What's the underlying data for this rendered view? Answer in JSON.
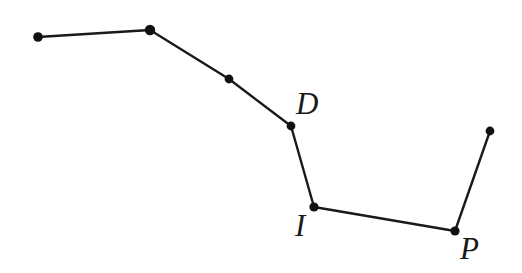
{
  "figure": {
    "background_color": "#ffffff",
    "line_color": "#1a1a1a",
    "node_color": "#111111",
    "label_color": "#1a1a1a",
    "width": 522,
    "height": 273
  },
  "chart_data": {
    "type": "scatter",
    "title": "",
    "xlabel": "",
    "ylabel": "",
    "xlim": [
      0,
      522
    ],
    "ylim": [
      273,
      0
    ],
    "grid": false,
    "legend": null,
    "nodes": [
      {
        "id": "n1",
        "label": "",
        "x": 38,
        "y": 37,
        "radius": 4.8
      },
      {
        "id": "n2",
        "label": "",
        "x": 150,
        "y": 30,
        "radius": 5.2
      },
      {
        "id": "n3",
        "label": "",
        "x": 229,
        "y": 79,
        "radius": 4.4
      },
      {
        "id": "n4",
        "label": "D",
        "x": 291,
        "y": 126,
        "radius": 4.4
      },
      {
        "id": "n5",
        "label": "I",
        "x": 314,
        "y": 207,
        "radius": 4.6
      },
      {
        "id": "n6",
        "label": "P",
        "x": 455,
        "y": 231,
        "radius": 4.6
      },
      {
        "id": "n7",
        "label": "",
        "x": 490,
        "y": 131,
        "radius": 4.4
      }
    ],
    "edges": [
      {
        "from": "n1",
        "to": "n2"
      },
      {
        "from": "n2",
        "to": "n3"
      },
      {
        "from": "n3",
        "to": "n4"
      },
      {
        "from": "n4",
        "to": "n5"
      },
      {
        "from": "n5",
        "to": "n6"
      },
      {
        "from": "n6",
        "to": "n7"
      }
    ],
    "polyline_points": "38,37 150,30 229,79 291,126 314,207 455,231 490,131",
    "line_width": 2.4
  },
  "labels": {
    "d": {
      "text": "D",
      "x": 296,
      "y": 88
    },
    "i": {
      "text": "I",
      "x": 295,
      "y": 210
    },
    "p": {
      "text": "P",
      "x": 460,
      "y": 233
    }
  }
}
